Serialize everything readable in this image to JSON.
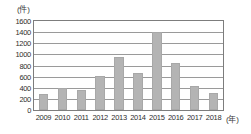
{
  "chart_data": {
    "type": "bar",
    "title": "",
    "subtitle": "",
    "xlabel": "(年)",
    "ylabel": "(件)",
    "categories": [
      "2009",
      "2010",
      "2011",
      "2012",
      "2013",
      "2014",
      "2015",
      "2016",
      "2017",
      "2018"
    ],
    "values": [
      290,
      400,
      355,
      610,
      960,
      670,
      1400,
      840,
      440,
      310
    ],
    "series": [
      {
        "name": "件数",
        "values": [
          290,
          400,
          355,
          610,
          960,
          670,
          1400,
          840,
          440,
          310
        ]
      }
    ],
    "ylim": [
      0,
      1600
    ],
    "ytick_labels": [
      "1600",
      "1400",
      "1200",
      "1000",
      "800",
      "600",
      "400",
      "200",
      "0"
    ],
    "ytick_values": [
      1600,
      1400,
      1200,
      1000,
      800,
      600,
      400,
      200,
      0
    ],
    "grid": true,
    "grid_axis": "y",
    "legend": false,
    "legend_position": "none",
    "bar_color": "#b4b4b4",
    "grid_color": "#9a9a9a",
    "axis_color": "#7d7d7d",
    "text_color": "#2e2e2e"
  },
  "axis": {
    "y_unit_label": "(件)",
    "x_unit_label": "(年)"
  }
}
